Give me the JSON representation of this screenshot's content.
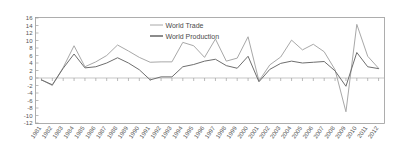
{
  "chart_data": {
    "type": "line",
    "title": "",
    "subtitle": "",
    "xlabel": "",
    "ylabel": "",
    "x": [
      "1981",
      "1982",
      "1983",
      "1984",
      "1985",
      "1986",
      "1987",
      "1988",
      "1989",
      "1990",
      "1991",
      "1992",
      "1993",
      "1994",
      "1995",
      "1996",
      "1997",
      "1998",
      "1999",
      "2000",
      "2001",
      "2002",
      "2003",
      "2004",
      "2005",
      "2006",
      "2007",
      "2008",
      "2009",
      "2010",
      "2011",
      "2012"
    ],
    "series": [
      {
        "name": "World Trade",
        "color": "#a8a8a8",
        "values": [
          -0.5,
          -2.0,
          2.8,
          8.6,
          3.0,
          4.3,
          6.0,
          8.8,
          7.2,
          5.5,
          4.2,
          4.3,
          4.3,
          9.5,
          8.6,
          5.5,
          10.4,
          4.5,
          5.3,
          11.0,
          -0.8,
          3.5,
          5.6,
          10.1,
          7.5,
          9.0,
          7.0,
          2.2,
          -9.0,
          14.3,
          5.8,
          2.6
        ]
      },
      {
        "name": "World Production",
        "color": "#6e6e6e",
        "values": [
          -0.5,
          -1.8,
          2.6,
          6.4,
          2.7,
          3.0,
          4.0,
          5.4,
          4.0,
          2.2,
          -0.5,
          0.3,
          0.3,
          3.0,
          3.6,
          4.5,
          5.0,
          3.3,
          2.6,
          5.8,
          -1.0,
          2.3,
          3.9,
          4.5,
          4.0,
          4.2,
          4.4,
          1.9,
          -2.2,
          6.8,
          3.0,
          2.5
        ]
      }
    ],
    "ylim": [
      -12,
      16
    ],
    "ytick_step": 2,
    "yticks": [
      "16",
      "14",
      "12",
      "10",
      "8",
      "6",
      "4",
      "2",
      "0",
      "-2",
      "-4",
      "-6",
      "-8",
      "-10",
      "-12"
    ],
    "grid": false,
    "legend_position": "top-center"
  }
}
